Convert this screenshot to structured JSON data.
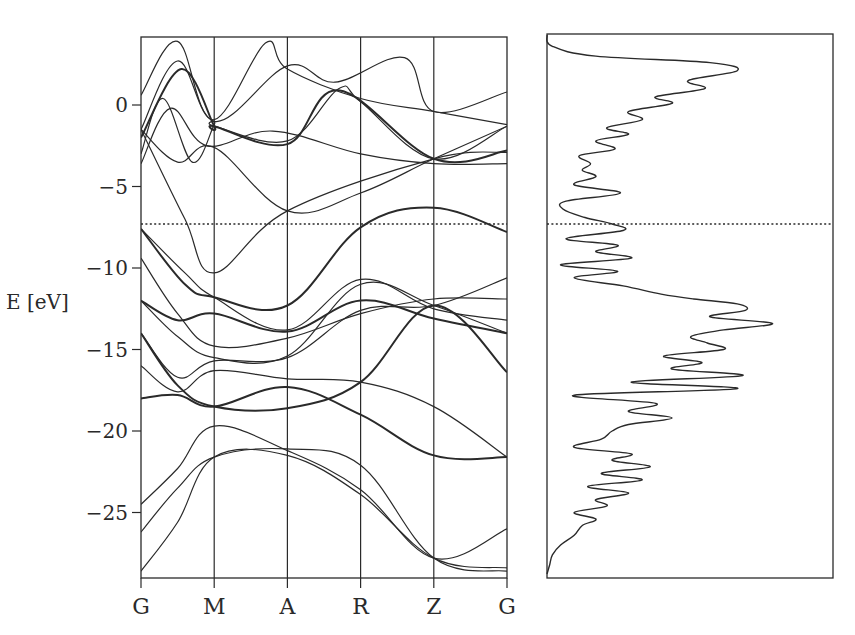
{
  "chart_data": [
    {
      "type": "line",
      "title": "",
      "subtitle": "Electronic band structure",
      "xlabel": "",
      "ylabel": "E [eV]",
      "ylim": [
        -29.0,
        4.2
      ],
      "yticks": [
        0,
        -5,
        -10,
        -15,
        -20,
        -25
      ],
      "ytick_labels": [
        "0",
        "−5",
        "−10",
        "−15",
        "−20",
        "−25"
      ],
      "k_points": [
        "G",
        "M",
        "A",
        "R",
        "Z",
        "G"
      ],
      "grid": false,
      "reference_line": {
        "style": "dotted",
        "energy": -7.3
      },
      "bands": [
        {
          "name": "band-1",
          "values": [
            0.6,
            3.9,
            -1.0,
            2.4,
            1.4,
            2.9,
            -0.4,
            0.8
          ],
          "x": [
            0,
            0.5,
            1,
            2,
            2.65,
            3.6,
            4,
            5
          ]
        },
        {
          "name": "band-2",
          "values": [
            -1.5,
            2.7,
            -0.9,
            3.8,
            2.2,
            0.4,
            -0.4,
            -1.2
          ],
          "x": [
            0,
            0.5,
            1,
            1.7,
            2,
            3,
            4,
            5
          ]
        },
        {
          "name": "band-3",
          "values": [
            -3.0,
            0.4,
            -3.5,
            -1.2,
            -1.3,
            -2.2,
            1.0,
            0.2,
            -3.3,
            -1.3
          ],
          "x": [
            0,
            0.3,
            0.7,
            1,
            1.0,
            2,
            2.7,
            3,
            4,
            5
          ]
        },
        {
          "name": "band-4",
          "values": [
            -2.0,
            2.2,
            -1.3,
            -1.3,
            -2.4,
            0.9,
            -3.3,
            -2.8
          ],
          "x": [
            0,
            0.55,
            1,
            1.0,
            2,
            2.7,
            4,
            5
          ]
        },
        {
          "name": "band-5",
          "values": [
            -3.6,
            -0.2,
            -2.5,
            -1.6,
            -3.0,
            -3.6,
            -3.6
          ],
          "x": [
            0,
            0.4,
            0.9,
            1.8,
            3,
            4,
            5
          ]
        },
        {
          "name": "band-6",
          "values": [
            -1.5,
            -3.5,
            -2.6,
            -6.5,
            -5.4,
            -3.3,
            -1.3
          ],
          "x": [
            0,
            0.5,
            1,
            2,
            3,
            4,
            5
          ]
        },
        {
          "name": "band-7",
          "values": [
            -1.5,
            -7.0,
            -10.3,
            -6.5,
            -3.3,
            -2.9
          ],
          "x": [
            0,
            0.6,
            1,
            2,
            4,
            5
          ]
        },
        {
          "name": "band-8",
          "values": [
            -7.6,
            -11.0,
            -11.8,
            -12.3,
            -7.5,
            -6.3,
            -7.8
          ],
          "x": [
            0,
            0.6,
            1,
            2,
            3,
            4,
            5
          ]
        },
        {
          "name": "band-9",
          "values": [
            -7.6,
            -10.3,
            -11.8,
            -13.8,
            -10.7,
            -12.5,
            -13.2
          ],
          "x": [
            0,
            0.6,
            1,
            2,
            3,
            4,
            5
          ]
        },
        {
          "name": "band-10",
          "values": [
            -9.4,
            -12.8,
            -14.8,
            -14.3,
            -12.8,
            -11.9,
            -11.9
          ],
          "x": [
            0,
            0.5,
            1,
            2,
            3,
            4,
            5
          ]
        },
        {
          "name": "band-11",
          "values": [
            -12.0,
            -14.2,
            -15.5,
            -15.4,
            -11.0,
            -12.3,
            -14.0
          ],
          "x": [
            0,
            0.5,
            1,
            2,
            3,
            4,
            5
          ]
        },
        {
          "name": "band-12",
          "values": [
            -12.0,
            -13.2,
            -12.8,
            -13.9,
            -12.0,
            -13.1,
            -14.0
          ],
          "x": [
            0,
            0.5,
            1,
            2,
            3,
            4,
            5
          ]
        },
        {
          "name": "band-13",
          "values": [
            -14.0,
            -16.7,
            -15.7,
            -15.5,
            -12.6,
            -12.3,
            -10.6
          ],
          "x": [
            0,
            0.5,
            1,
            2,
            3,
            4,
            5
          ]
        },
        {
          "name": "band-14",
          "values": [
            -14.0,
            -17.2,
            -18.5,
            -18.6,
            -17.0,
            -12.3,
            -16.4
          ],
          "x": [
            0,
            0.5,
            1,
            2,
            3,
            4,
            5
          ]
        },
        {
          "name": "band-15",
          "values": [
            -16.0,
            -17.6,
            -16.3,
            -16.8,
            -17.0,
            -18.5,
            -21.6
          ],
          "x": [
            0,
            0.5,
            1,
            2,
            3,
            4,
            5
          ]
        },
        {
          "name": "band-16",
          "values": [
            -18.0,
            -17.8,
            -18.5,
            -17.3,
            -19.0,
            -21.5,
            -21.6
          ],
          "x": [
            0,
            0.5,
            1,
            2,
            3,
            4,
            5
          ]
        },
        {
          "name": "band-17",
          "values": [
            -24.5,
            -22.3,
            -19.7,
            -21.2,
            -23.6,
            -27.8,
            -26.0
          ],
          "x": [
            0,
            0.5,
            1,
            2,
            3,
            4,
            5
          ]
        },
        {
          "name": "band-18",
          "values": [
            -26.2,
            -23.5,
            -21.6,
            -21.1,
            -22.1,
            -27.8,
            -28.6
          ],
          "x": [
            0,
            0.5,
            1,
            2,
            3,
            4,
            5
          ]
        },
        {
          "name": "band-19",
          "values": [
            -28.6,
            -25.6,
            -21.6,
            -21.5,
            -23.9,
            -27.8,
            -28.4
          ],
          "x": [
            0,
            0.5,
            1,
            2,
            3,
            4,
            5
          ]
        }
      ],
      "thick_bands": [
        "band-4",
        "band-8",
        "band-12",
        "band-14",
        "band-16"
      ]
    },
    {
      "type": "line",
      "title": "",
      "subtitle": "Density of states",
      "xlabel": "",
      "ylabel": "",
      "orientation": "vertical (energy on shared y-axis, DOS increasing to the right)",
      "ylim": [
        -29.0,
        4.2
      ],
      "xlim": [
        0,
        1
      ],
      "reference_line": {
        "style": "dotted",
        "energy": -7.3
      },
      "energy": [
        4.2,
        3.6,
        3.0,
        2.6,
        2.1,
        1.5,
        1.0,
        0.5,
        0.1,
        -0.4,
        -0.9,
        -1.4,
        -1.8,
        -2.2,
        -2.7,
        -3.1,
        -3.6,
        -4.0,
        -4.4,
        -4.9,
        -5.4,
        -5.9,
        -6.4,
        -6.9,
        -7.3,
        -7.7,
        -8.2,
        -8.6,
        -9.0,
        -9.4,
        -9.8,
        -10.2,
        -10.6,
        -11.1,
        -11.6,
        -11.9,
        -12.2,
        -12.6,
        -13.0,
        -13.4,
        -13.8,
        -14.2,
        -14.6,
        -15.0,
        -15.4,
        -15.8,
        -16.2,
        -16.6,
        -17.0,
        -17.4,
        -17.8,
        -18.3,
        -18.8,
        -19.2,
        -19.6,
        -20.0,
        -20.5,
        -21.0,
        -21.4,
        -21.8,
        -22.2,
        -22.6,
        -23.0,
        -23.4,
        -23.8,
        -24.2,
        -24.6,
        -25.0,
        -25.4,
        -25.8,
        -26.4,
        -27.0,
        -27.6,
        -28.2,
        -28.9
      ],
      "dos": [
        0.0,
        0.02,
        0.18,
        0.6,
        0.7,
        0.52,
        0.58,
        0.4,
        0.46,
        0.3,
        0.35,
        0.22,
        0.3,
        0.18,
        0.25,
        0.12,
        0.16,
        0.13,
        0.18,
        0.1,
        0.27,
        0.07,
        0.06,
        0.14,
        0.24,
        0.28,
        0.07,
        0.26,
        0.18,
        0.31,
        0.05,
        0.26,
        0.1,
        0.28,
        0.42,
        0.54,
        0.7,
        0.73,
        0.6,
        0.83,
        0.65,
        0.53,
        0.59,
        0.65,
        0.43,
        0.57,
        0.46,
        0.72,
        0.31,
        0.7,
        0.1,
        0.4,
        0.3,
        0.46,
        0.3,
        0.24,
        0.2,
        0.1,
        0.31,
        0.24,
        0.38,
        0.2,
        0.35,
        0.15,
        0.3,
        0.18,
        0.22,
        0.1,
        0.18,
        0.13,
        0.1,
        0.05,
        0.02,
        0.01,
        0.0
      ]
    }
  ],
  "band_plot": {
    "ylabel": "E [eV]",
    "ytick_labels": [
      "0",
      "−5",
      "−10",
      "−15",
      "−20",
      "−25"
    ],
    "k_labels": [
      "G",
      "M",
      "A",
      "R",
      "Z",
      "G"
    ]
  },
  "colors": {
    "ink": "#2a2a2a",
    "background": "#ffffff"
  }
}
